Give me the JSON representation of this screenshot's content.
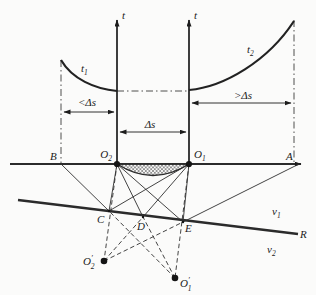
{
  "figure": {
    "axes": {
      "left_label": "t",
      "right_label": "t"
    },
    "curves": {
      "t1": {
        "base": "t",
        "sub": "1"
      },
      "t2": {
        "base": "t",
        "sub": "2"
      }
    },
    "interval_arrows": {
      "less_than": "<Δs",
      "middle": "Δs",
      "greater_than": ">Δs"
    },
    "surface_points": {
      "B": "B",
      "A": "A",
      "O2": {
        "base": "O",
        "sub": "2"
      },
      "O1": {
        "base": "O",
        "sub": "1"
      }
    },
    "refractor_points": {
      "C": "C",
      "D": "D",
      "E": "E"
    },
    "image_points": {
      "O2_prime": {
        "base": "O",
        "prime": "′",
        "sub": "2"
      },
      "O1_prime": {
        "base": "O",
        "prime": "′",
        "sub": "1"
      }
    },
    "velocities": {
      "v1": {
        "base": "v",
        "sub": "1"
      },
      "v2": {
        "base": "v",
        "sub": "2"
      }
    },
    "refractor_label": "R",
    "colors": {
      "ink": "#1c1c1c",
      "line": "#2b2b2b",
      "background": "#fbfbfa"
    }
  }
}
